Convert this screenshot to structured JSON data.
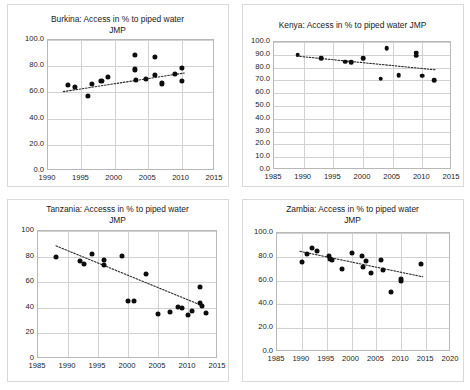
{
  "figure": {
    "panel_count": 4,
    "marker_color": "#0d0d0d",
    "trendline_color": "#2b2b2b",
    "grid_color": "#d2d2d2",
    "axis_color": "#b8b8b8"
  },
  "chart_data": [
    {
      "type": "scatter",
      "id": "burkina",
      "title": "Burkina: Access in % to piped water\nJMP",
      "xlabel": "",
      "ylabel": "",
      "xlim": [
        1990,
        2015
      ],
      "ylim": [
        0,
        100
      ],
      "xticks": [
        "1990",
        "1995",
        "2000",
        "2005",
        "2010",
        "2015"
      ],
      "yticks": [
        "0.0",
        "20.0",
        "40.0",
        "60.0",
        "80.0",
        "100.0"
      ],
      "grid": true,
      "legend": "none",
      "points": [
        {
          "x": 1993.0,
          "y": 65.8
        },
        {
          "x": 1994.0,
          "y": 64.3
        },
        {
          "x": 1996.0,
          "y": 57.6
        },
        {
          "x": 1996.6,
          "y": 66.6
        },
        {
          "x": 1998.0,
          "y": 69.0
        },
        {
          "x": 1999.0,
          "y": 72.0
        },
        {
          "x": 2003.0,
          "y": 88.6
        },
        {
          "x": 2003.0,
          "y": 77.6
        },
        {
          "x": 2003.2,
          "y": 69.4
        },
        {
          "x": 2004.7,
          "y": 70.6
        },
        {
          "x": 2006.0,
          "y": 87.3
        },
        {
          "x": 2006.0,
          "y": 73.2
        },
        {
          "x": 2007.0,
          "y": 66.9
        },
        {
          "x": 2009.0,
          "y": 74.4
        },
        {
          "x": 2010.0,
          "y": 78.5
        },
        {
          "x": 2010.0,
          "y": 68.6
        }
      ],
      "trendline": {
        "x0": 1992.3,
        "y0": 60.6,
        "x1": 2010.4,
        "y1": 74.8
      }
    },
    {
      "type": "scatter",
      "id": "kenya",
      "title": "Kenya: Access in % to piped water JMP",
      "xlabel": "",
      "ylabel": "",
      "xlim": [
        1985,
        2015
      ],
      "ylim": [
        0,
        100
      ],
      "xticks": [
        "1985",
        "1990",
        "1995",
        "2000",
        "2005",
        "2010",
        "2015"
      ],
      "yticks": [
        "0.0",
        "10.0",
        "20.0",
        "30.0",
        "40.0",
        "50.0",
        "60.0",
        "70.0",
        "80.0",
        "90.0",
        "100.0"
      ],
      "grid": true,
      "legend": "none",
      "points": [
        {
          "x": 1989.0,
          "y": 90.2
        },
        {
          "x": 1993.0,
          "y": 87.3
        },
        {
          "x": 1997.0,
          "y": 84.6
        },
        {
          "x": 1998.0,
          "y": 84.4
        },
        {
          "x": 2000.0,
          "y": 87.4
        },
        {
          "x": 2003.0,
          "y": 71.2
        },
        {
          "x": 2004.0,
          "y": 95.2
        },
        {
          "x": 2006.0,
          "y": 74.2
        },
        {
          "x": 2009.0,
          "y": 91.6
        },
        {
          "x": 2009.0,
          "y": 89.2
        },
        {
          "x": 2010.0,
          "y": 73.8
        },
        {
          "x": 2012.0,
          "y": 70.1
        }
      ],
      "trendline": {
        "x0": 1988.8,
        "y0": 89.0,
        "x1": 2012.3,
        "y1": 78.2
      }
    },
    {
      "type": "scatter",
      "id": "tanzania",
      "title": "Tanzania: Accesss in % to piped water\nJMP",
      "xlabel": "",
      "ylabel": "",
      "xlim": [
        1985,
        2015
      ],
      "ylim": [
        0,
        100
      ],
      "xticks": [
        "1985",
        "1990",
        "1995",
        "2000",
        "2005",
        "2010",
        "2015"
      ],
      "yticks": [
        "0",
        "20",
        "40",
        "60",
        "80",
        "100"
      ],
      "grid": true,
      "legend": "none",
      "points": [
        {
          "x": 1988.0,
          "y": 79.6
        },
        {
          "x": 1992.0,
          "y": 76.3
        },
        {
          "x": 1992.6,
          "y": 74.4
        },
        {
          "x": 1994.0,
          "y": 82.4
        },
        {
          "x": 1996.0,
          "y": 77.6
        },
        {
          "x": 1996.0,
          "y": 73.5
        },
        {
          "x": 1999.0,
          "y": 80.3
        },
        {
          "x": 2000.0,
          "y": 45.4
        },
        {
          "x": 2001.0,
          "y": 45.2
        },
        {
          "x": 2003.0,
          "y": 66.6
        },
        {
          "x": 2005.0,
          "y": 34.8
        },
        {
          "x": 2007.0,
          "y": 36.4
        },
        {
          "x": 2008.3,
          "y": 40.6
        },
        {
          "x": 2009.0,
          "y": 39.6
        },
        {
          "x": 2010.0,
          "y": 34.3
        },
        {
          "x": 2010.6,
          "y": 37.5
        },
        {
          "x": 2012.0,
          "y": 56.2
        },
        {
          "x": 2012.0,
          "y": 43.4
        },
        {
          "x": 2012.3,
          "y": 41.2
        },
        {
          "x": 2013.0,
          "y": 36.2
        }
      ],
      "trendline": {
        "x0": 1988.0,
        "y0": 88.4,
        "x1": 2012.4,
        "y1": 41.6
      }
    },
    {
      "type": "scatter",
      "id": "zambia",
      "title": "Zambia: Access in % to piped water\nJMP",
      "xlabel": "",
      "ylabel": "",
      "xlim": [
        1985,
        2020
      ],
      "ylim": [
        0,
        100
      ],
      "xticks": [
        "1985",
        "1990",
        "1995",
        "2000",
        "2005",
        "2010",
        "2015",
        "2020"
      ],
      "yticks": [
        "0.0",
        "20.0",
        "40.0",
        "60.0",
        "80.0",
        "100.0"
      ],
      "grid": true,
      "legend": "none",
      "points": [
        {
          "x": 1990.0,
          "y": 76.0
        },
        {
          "x": 1991.0,
          "y": 82.3
        },
        {
          "x": 1992.0,
          "y": 87.4
        },
        {
          "x": 1993.0,
          "y": 85.0
        },
        {
          "x": 1995.4,
          "y": 80.6
        },
        {
          "x": 1995.6,
          "y": 78.0
        },
        {
          "x": 1996.0,
          "y": 77.6
        },
        {
          "x": 1998.0,
          "y": 69.8
        },
        {
          "x": 2000.0,
          "y": 83.6
        },
        {
          "x": 2002.0,
          "y": 80.8
        },
        {
          "x": 2002.2,
          "y": 71.6
        },
        {
          "x": 2003.0,
          "y": 76.6
        },
        {
          "x": 2004.0,
          "y": 66.2
        },
        {
          "x": 2006.0,
          "y": 77.2
        },
        {
          "x": 2006.4,
          "y": 68.8
        },
        {
          "x": 2008.0,
          "y": 50.8
        },
        {
          "x": 2010.0,
          "y": 61.0
        },
        {
          "x": 2010.0,
          "y": 59.4
        },
        {
          "x": 2014.0,
          "y": 73.6
        }
      ],
      "trendline": {
        "x0": 1989.6,
        "y0": 84.6,
        "x1": 2014.3,
        "y1": 63.2
      }
    }
  ]
}
